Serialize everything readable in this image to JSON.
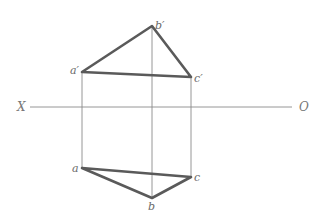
{
  "diagram": {
    "type": "orthographic-projection-triangle",
    "axis": {
      "left_label": "X",
      "right_label": "O"
    },
    "front_view": {
      "points": [
        {
          "name": "a_prime",
          "label": "a′",
          "x": 82,
          "y": 72
        },
        {
          "name": "b_prime",
          "label": "b′",
          "x": 152,
          "y": 26
        },
        {
          "name": "c_prime",
          "label": "c′",
          "x": 191,
          "y": 77
        }
      ]
    },
    "top_view": {
      "points": [
        {
          "name": "a",
          "label": "a",
          "x": 82,
          "y": 168
        },
        {
          "name": "b",
          "label": "b",
          "x": 152,
          "y": 198
        },
        {
          "name": "c",
          "label": "c",
          "x": 191,
          "y": 177
        }
      ]
    },
    "colors": {
      "thick_line": "#5a5a5a",
      "thin_line": "#8a8a8a",
      "label": "#6a6a6a"
    }
  }
}
